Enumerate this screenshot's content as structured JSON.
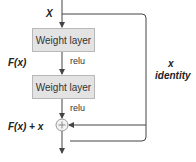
{
  "diagram": {
    "input_label": "X",
    "layers": [
      {
        "label": "Weight layer",
        "activation": "relu"
      },
      {
        "label": "Weight layer",
        "activation": "relu"
      }
    ],
    "fx_label": "F(x)",
    "sum_label": "F(x) + x",
    "sum_symbol": "+",
    "shortcut": {
      "var": "x",
      "label": "identity"
    }
  },
  "colors": {
    "box_fill": "#e3e3e3",
    "box_border": "#b8b8b8",
    "line": "#444444",
    "text": "#222222"
  }
}
